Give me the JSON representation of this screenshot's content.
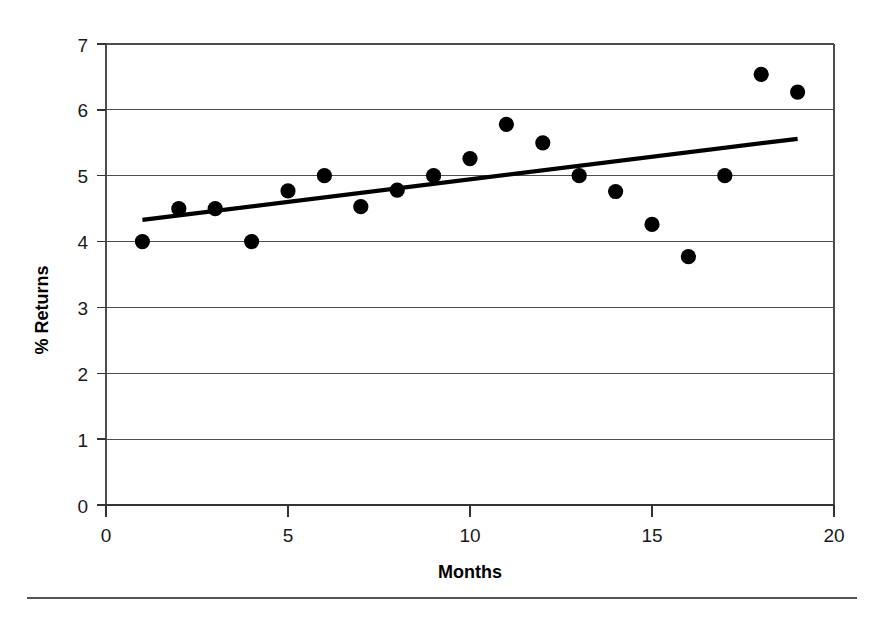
{
  "chart_data": {
    "type": "scatter",
    "title": "",
    "xlabel": "Months",
    "ylabel": "% Returns",
    "xlim": [
      0,
      20
    ],
    "ylim": [
      0,
      7
    ],
    "xticks": [
      0,
      5,
      10,
      15,
      20
    ],
    "yticks": [
      0,
      1,
      2,
      3,
      4,
      5,
      6,
      7
    ],
    "xtick_labels": [
      "0",
      "5",
      "10",
      "15",
      "20"
    ],
    "ytick_labels": [
      "0",
      "1",
      "2",
      "3",
      "4",
      "5",
      "6",
      "7"
    ],
    "grid": "horizontal",
    "legend": "none",
    "x": [
      1,
      2,
      3,
      4,
      5,
      6,
      7,
      8,
      9,
      10,
      11,
      12,
      13,
      14,
      15,
      16,
      17,
      18,
      19
    ],
    "values": [
      4.0,
      4.5,
      4.5,
      4.0,
      4.77,
      5.0,
      4.53,
      4.78,
      5.0,
      5.26,
      5.78,
      5.5,
      5.0,
      4.76,
      4.26,
      3.77,
      5.0,
      6.54,
      6.27
    ],
    "series": [
      {
        "name": "% Returns",
        "marker": "filled-circle",
        "color": "#000000",
        "values": [
          4.0,
          4.5,
          4.5,
          4.0,
          4.77,
          5.0,
          4.53,
          4.78,
          5.0,
          5.26,
          5.78,
          5.5,
          5.0,
          4.76,
          4.26,
          3.77,
          5.0,
          6.54,
          6.27
        ]
      },
      {
        "name": "trendline",
        "type": "line",
        "color": "#000000",
        "x": [
          1.0,
          19.0
        ],
        "values": [
          4.33,
          5.56
        ]
      }
    ]
  },
  "figure": {
    "axis_x_title": "Months",
    "axis_y_title": "% Returns"
  }
}
